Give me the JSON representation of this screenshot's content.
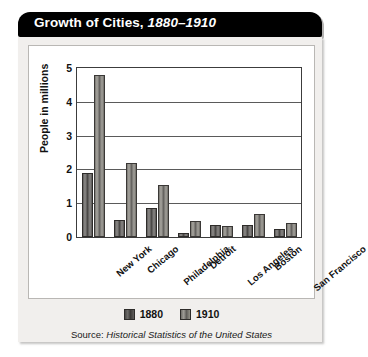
{
  "title": {
    "main": "Growth of Cities,",
    "range": "1880–1910"
  },
  "source": {
    "prefix": "Source:",
    "title": "Historical Statistics of the United States"
  },
  "legend": {
    "items": [
      {
        "label": "1880",
        "color": "#4a4846"
      },
      {
        "label": "1910",
        "color": "#8e8c87"
      }
    ]
  },
  "chart_data": {
    "type": "bar",
    "title": "Growth of Cities, 1880–1910",
    "xlabel": "",
    "ylabel": "People in millions",
    "ylim": [
      0,
      5
    ],
    "yticks": [
      "0",
      "1",
      "2",
      "3",
      "4",
      "5"
    ],
    "grid": true,
    "legend_position": "bottom",
    "categories": [
      "New York",
      "Chicago",
      "Philadelphia",
      "Detroit",
      "Los Angeles",
      "Boston",
      "San Francisco"
    ],
    "series": [
      {
        "name": "1880",
        "color": "#4a4846",
        "values": [
          1.9,
          0.5,
          0.85,
          0.12,
          0.35,
          0.36,
          0.24
        ]
      },
      {
        "name": "1910",
        "color": "#8e8c87",
        "values": [
          4.78,
          2.2,
          1.55,
          0.46,
          0.32,
          0.68,
          0.42
        ]
      }
    ]
  }
}
